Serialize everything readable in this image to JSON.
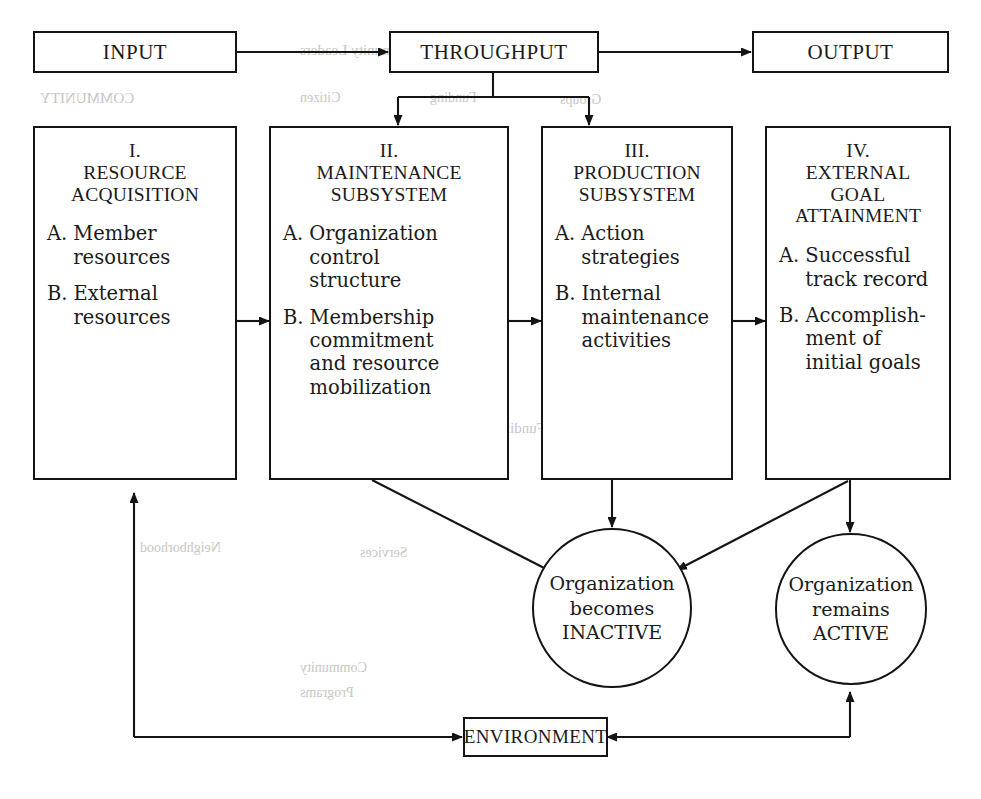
{
  "figure": {
    "ink_color": "#141414",
    "background_color": "#ffffff"
  },
  "top_row": {
    "input": {
      "label": "INPUT"
    },
    "throughput": {
      "label": "THROUGHPUT"
    },
    "output": {
      "label": "OUTPUT"
    }
  },
  "columns": [
    {
      "roman": "I.",
      "name_lines": [
        "RESOURCE",
        "ACQUISITION"
      ],
      "items": [
        {
          "mark": "A.",
          "lines": [
            "Member",
            "resources"
          ]
        },
        {
          "mark": "B.",
          "lines": [
            "External",
            "resources"
          ]
        }
      ]
    },
    {
      "roman": "II.",
      "name_lines": [
        "MAINTENANCE",
        "SUBSYSTEM"
      ],
      "items": [
        {
          "mark": "A.",
          "lines": [
            "Organization",
            "control",
            "structure"
          ]
        },
        {
          "mark": "B.",
          "lines": [
            "Membership",
            "commitment",
            "and resource",
            "mobilization"
          ]
        }
      ]
    },
    {
      "roman": "III.",
      "name_lines": [
        "PRODUCTION",
        "SUBSYSTEM"
      ],
      "items": [
        {
          "mark": "A.",
          "lines": [
            "Action",
            "strategies"
          ]
        },
        {
          "mark": "B.",
          "lines": [
            "Internal",
            "maintenance",
            "activities"
          ]
        }
      ]
    },
    {
      "roman": "IV.",
      "name_lines": [
        "EXTERNAL",
        "GOAL",
        "ATTAINMENT"
      ],
      "items": [
        {
          "mark": "A.",
          "lines": [
            "Successful",
            "track record"
          ]
        },
        {
          "mark": "B.",
          "lines": [
            "Accomplish-",
            "ment of",
            "initial goals"
          ]
        }
      ]
    }
  ],
  "outcomes": [
    {
      "lines": [
        "Organization",
        "becomes",
        "INACTIVE"
      ]
    },
    {
      "lines": [
        "Organization",
        "remains",
        "ACTIVE"
      ]
    }
  ],
  "environment": {
    "label": "ENVIRONMENT"
  },
  "ghost_text": [
    {
      "text": "Community Leaders",
      "x": 300,
      "y": 42,
      "size": 15
    },
    {
      "text": "COMMUNITY",
      "x": 40,
      "y": 90,
      "size": 15
    },
    {
      "text": "Citizen",
      "x": 300,
      "y": 90,
      "size": 14
    },
    {
      "text": "Funding",
      "x": 430,
      "y": 90,
      "size": 14
    },
    {
      "text": "Groups",
      "x": 560,
      "y": 92,
      "size": 14
    },
    {
      "text": "Funding Needs Assessment",
      "x": 380,
      "y": 420,
      "size": 15
    },
    {
      "text": "Neighborhood",
      "x": 140,
      "y": 540,
      "size": 14
    },
    {
      "text": "Services",
      "x": 360,
      "y": 545,
      "size": 14
    },
    {
      "text": "Community",
      "x": 300,
      "y": 660,
      "size": 14
    },
    {
      "text": "Programs",
      "x": 300,
      "y": 685,
      "size": 14
    }
  ]
}
